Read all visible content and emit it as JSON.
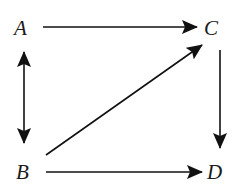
{
  "diagram": {
    "type": "directed-graph",
    "nodes": [
      {
        "id": "A",
        "label": "A",
        "x": 21,
        "y": 35
      },
      {
        "id": "C",
        "label": "C",
        "x": 212,
        "y": 35
      },
      {
        "id": "B",
        "label": "B",
        "x": 23,
        "y": 179
      },
      {
        "id": "D",
        "label": "D",
        "x": 215,
        "y": 179
      }
    ],
    "edges": [
      {
        "from": "A",
        "to": "C",
        "direction": "forward"
      },
      {
        "from": "A",
        "to": "B",
        "direction": "bidirectional"
      },
      {
        "from": "B",
        "to": "C",
        "direction": "forward"
      },
      {
        "from": "C",
        "to": "D",
        "direction": "forward"
      },
      {
        "from": "B",
        "to": "D",
        "direction": "forward"
      }
    ],
    "colors": {
      "stroke": "#111111",
      "text": "#1a1a1a",
      "background": "#ffffff"
    }
  }
}
